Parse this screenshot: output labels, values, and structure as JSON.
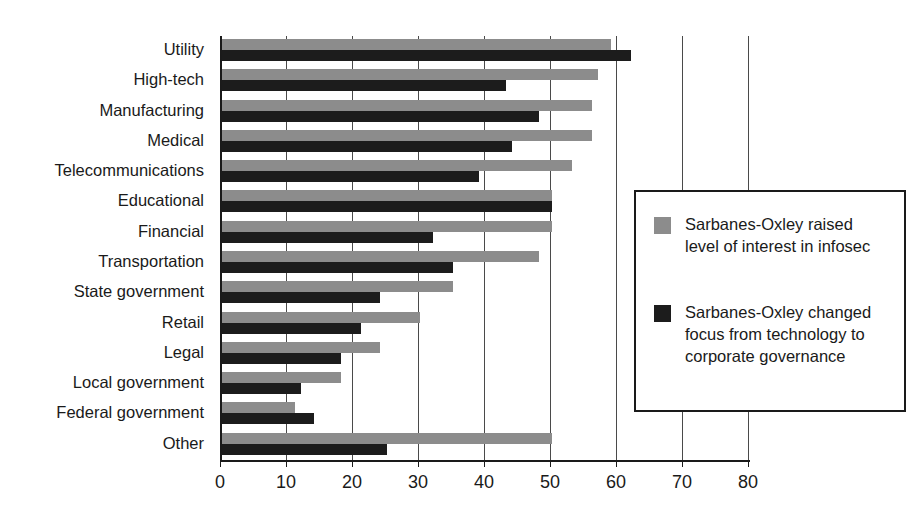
{
  "chart_data": {
    "type": "bar",
    "orientation": "horizontal",
    "title": "",
    "xlabel": "",
    "ylabel": "",
    "xlim": [
      0,
      80
    ],
    "xticks": [
      0,
      10,
      20,
      30,
      40,
      50,
      60,
      70,
      80
    ],
    "xtick_labels": [
      "0",
      "10",
      "20",
      "30",
      "40",
      "50",
      "60",
      "70",
      "80"
    ],
    "grid": true,
    "legend_position": "right",
    "categories": [
      "Utility",
      "High-tech",
      "Manufacturing",
      "Medical",
      "Telecommunications",
      "Educational",
      "Financial",
      "Transportation",
      "State government",
      "Retail",
      "Legal",
      "Local government",
      "Federal government",
      "Other"
    ],
    "series": [
      {
        "name": "Sarbanes-Oxley raised level of interest in infosec",
        "color": "#8c8c8c",
        "values": [
          59,
          57,
          56,
          56,
          53,
          50,
          50,
          48,
          35,
          30,
          24,
          18,
          11,
          50
        ]
      },
      {
        "name": "Sarbanes-Oxley changed focus from technology to corporate governance",
        "color": "#1c1c1c",
        "values": [
          62,
          43,
          48,
          44,
          39,
          50,
          32,
          35,
          24,
          21,
          18,
          12,
          14,
          25
        ]
      }
    ]
  },
  "legend": {
    "entries": [
      {
        "label": "Sarbanes-Oxley raised level of interest in infosec",
        "color": "#8c8c8c"
      },
      {
        "label": "Sarbanes-Oxley changed focus from technology to corporate governance",
        "color": "#1c1c1c"
      }
    ]
  },
  "colors": {
    "series_light": "#8c8c8c",
    "series_dark": "#1c1c1c",
    "axis": "#1a1a1a",
    "grid": "#4a4a4a",
    "background": "#ffffff"
  }
}
